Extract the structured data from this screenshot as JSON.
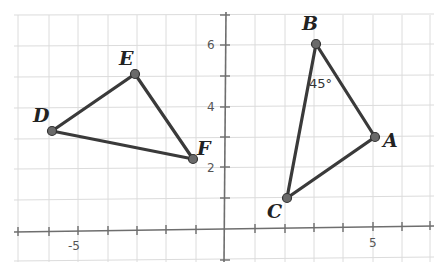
{
  "diagram": {
    "type": "coordinate-plane",
    "axes": {
      "x_tick_labels": [
        {
          "value": -5,
          "label": "-5"
        },
        {
          "value": 5,
          "label": "5"
        }
      ],
      "y_tick_labels": [
        {
          "value": 2,
          "label": "2"
        },
        {
          "value": 4,
          "label": "4"
        },
        {
          "value": 6,
          "label": "6"
        }
      ],
      "x_range": [
        -7,
        6
      ],
      "y_range": [
        -1,
        7
      ]
    },
    "triangles": [
      {
        "name": "DEF",
        "vertices": [
          {
            "label": "D",
            "x": -6,
            "y": 3.2
          },
          {
            "label": "E",
            "x": -3,
            "y": 5.1
          },
          {
            "label": "F",
            "x": -1.1,
            "y": 2.3
          }
        ]
      },
      {
        "name": "ABC",
        "vertices": [
          {
            "label": "A",
            "x": 5.1,
            "y": 3
          },
          {
            "label": "B",
            "x": 3.1,
            "y": 6
          },
          {
            "label": "C",
            "x": 2.1,
            "y": 1
          }
        ],
        "angle_annotation": {
          "vertex": "B",
          "text": "45°"
        }
      }
    ],
    "colors": {
      "segments": "#3a3a3a",
      "points": "#6a6a6a",
      "grid": "#dcdcdc",
      "axes": "#6e6e6e"
    }
  }
}
